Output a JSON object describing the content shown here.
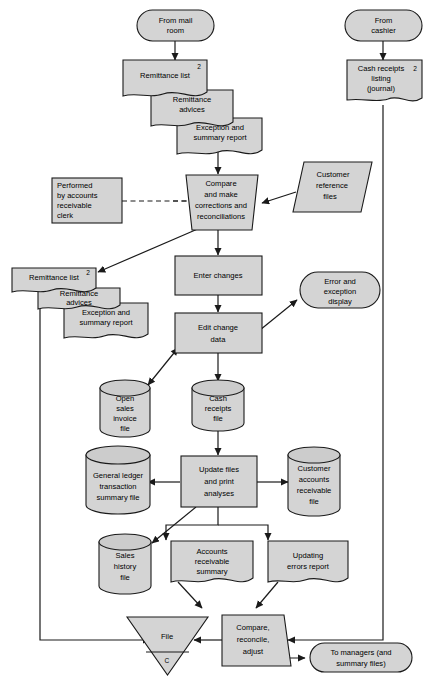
{
  "diagram": {
    "background_color": "#ffffff",
    "shape_fill": "#d4d4d4",
    "shape_stroke": "#1a1a1a"
  },
  "nodes": {
    "from_mail_room": {
      "label_line1": "From mail",
      "label_line2": "room",
      "shape": "terminator"
    },
    "from_cashier": {
      "label_line1": "From",
      "label_line2": "cashier",
      "shape": "terminator"
    },
    "remittance_list_1": {
      "label": "Remittance list",
      "copies": "2",
      "shape": "document"
    },
    "remittance_advices_1": {
      "label_line1": "Remittance",
      "label_line2": "advices",
      "shape": "document"
    },
    "exception_summary_1": {
      "label_line1": "Exception and",
      "label_line2": "summary report",
      "shape": "document"
    },
    "cash_receipts_listing": {
      "label_line1": "Cash receipts",
      "label_line2": "listing",
      "label_line3": "(journal)",
      "copies": "2",
      "shape": "document"
    },
    "performed_by_clerk": {
      "label_line1": "Performed",
      "label_line2": "by accounts",
      "label_line3": "receivable",
      "label_line4": "clerk",
      "shape": "annotation"
    },
    "compare_make_corrections": {
      "label_line1": "Compare",
      "label_line2": "and make",
      "label_line3": "corrections and",
      "label_line4": "reconciliations",
      "shape": "manual-operation"
    },
    "customer_reference_files": {
      "label_line1": "Customer",
      "label_line2": "reference",
      "label_line3": "files",
      "shape": "parallelogram"
    },
    "remittance_list_2": {
      "label": "Remittance list",
      "copies": "2",
      "shape": "document"
    },
    "remittance_advices_2": {
      "label_line1": "Remittance",
      "label_line2": "advices",
      "shape": "document"
    },
    "exception_summary_2": {
      "label_line1": "Exception and",
      "label_line2": "summary report",
      "shape": "document"
    },
    "enter_changes": {
      "label": "Enter changes",
      "shape": "process"
    },
    "edit_change_data": {
      "label_line1": "Edit change",
      "label_line2": "data",
      "shape": "process"
    },
    "error_exception_display": {
      "label_line1": "Error and",
      "label_line2": "exception",
      "label_line3": "display",
      "shape": "display"
    },
    "open_sales_invoice_file": {
      "label_line1": "Open",
      "label_line2": "sales",
      "label_line3": "invoice",
      "label_line4": "file",
      "shape": "database"
    },
    "cash_receipts_file": {
      "label_line1": "Cash",
      "label_line2": "receipts",
      "label_line3": "file",
      "shape": "database"
    },
    "general_ledger_file": {
      "label_line1": "General ledger",
      "label_line2": "transaction",
      "label_line3": "summary file",
      "shape": "database"
    },
    "update_files_print": {
      "label_line1": "Update files",
      "label_line2": "and print",
      "label_line3": "analyses",
      "shape": "process"
    },
    "customer_accounts_file": {
      "label_line1": "Customer",
      "label_line2": "accounts",
      "label_line3": "receivable",
      "label_line4": "file",
      "shape": "database"
    },
    "sales_history_file": {
      "label_line1": "Sales",
      "label_line2": "history",
      "label_line3": "file",
      "shape": "database"
    },
    "accounts_receivable_summary": {
      "label_line1": "Accounts",
      "label_line2": "receivable",
      "label_line3": "summary",
      "shape": "document"
    },
    "updating_errors_report": {
      "label_line1": "Updating",
      "label_line2": "errors report",
      "shape": "document"
    },
    "file_triangle": {
      "label": "File",
      "sort_code": "C",
      "shape": "file-store"
    },
    "compare_reconcile_adjust": {
      "label_line1": "Compare,",
      "label_line2": "reconcile,",
      "label_line3": "adjust",
      "shape": "manual-operation"
    },
    "to_managers": {
      "label_line1": "To managers (and",
      "label_line2": "summary files)",
      "shape": "terminator"
    }
  }
}
